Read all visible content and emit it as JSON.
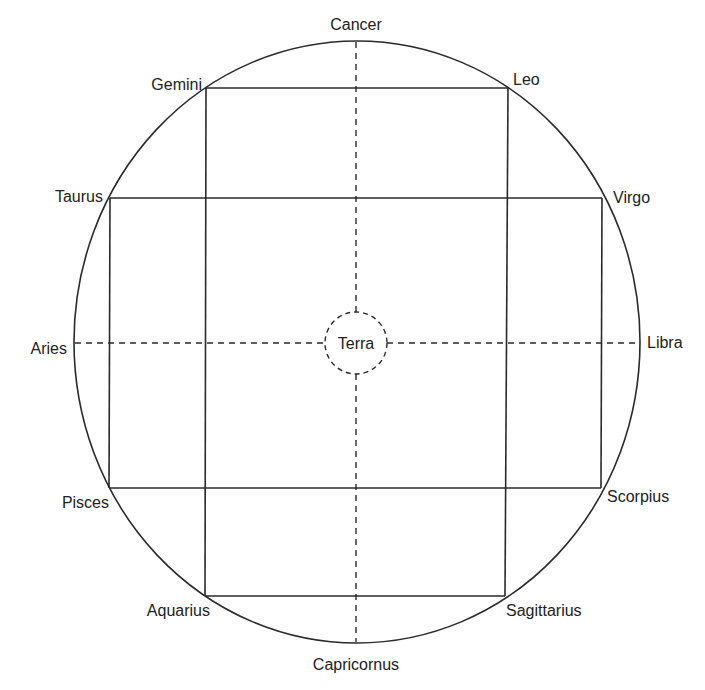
{
  "diagram": {
    "type": "geocentric zodiac diagram",
    "center_label": "Terra",
    "colors": {
      "stroke": "#2a2a2a",
      "text": "#222222",
      "background": "#ffffff"
    },
    "signs": [
      {
        "name": "Cancer",
        "position": "top"
      },
      {
        "name": "Leo",
        "position": "top-right"
      },
      {
        "name": "Virgo",
        "position": "upper-right"
      },
      {
        "name": "Libra",
        "position": "right"
      },
      {
        "name": "Scorpius",
        "position": "lower-right"
      },
      {
        "name": "Sagittarius",
        "position": "bottom-right"
      },
      {
        "name": "Capricornus",
        "position": "bottom"
      },
      {
        "name": "Aquarius",
        "position": "bottom-left"
      },
      {
        "name": "Pisces",
        "position": "lower-left"
      },
      {
        "name": "Aries",
        "position": "left"
      },
      {
        "name": "Taurus",
        "position": "upper-left"
      },
      {
        "name": "Gemini",
        "position": "top-left"
      }
    ],
    "lines": [
      {
        "type": "solid",
        "connects": [
          "Gemini",
          "Leo"
        ]
      },
      {
        "type": "solid",
        "connects": [
          "Taurus",
          "Virgo"
        ]
      },
      {
        "type": "solid",
        "connects": [
          "Pisces",
          "Scorpius"
        ]
      },
      {
        "type": "solid",
        "connects": [
          "Aquarius",
          "Sagittarius"
        ]
      },
      {
        "type": "solid",
        "connects": [
          "Gemini",
          "Aquarius"
        ]
      },
      {
        "type": "solid",
        "connects": [
          "Leo",
          "Sagittarius"
        ]
      },
      {
        "type": "solid",
        "connects": [
          "Taurus",
          "Pisces"
        ]
      },
      {
        "type": "solid",
        "connects": [
          "Virgo",
          "Scorpius"
        ]
      },
      {
        "type": "dashed",
        "connects": [
          "Cancer",
          "Capricornus"
        ]
      },
      {
        "type": "dashed",
        "connects": [
          "Aries",
          "Libra"
        ]
      }
    ]
  }
}
